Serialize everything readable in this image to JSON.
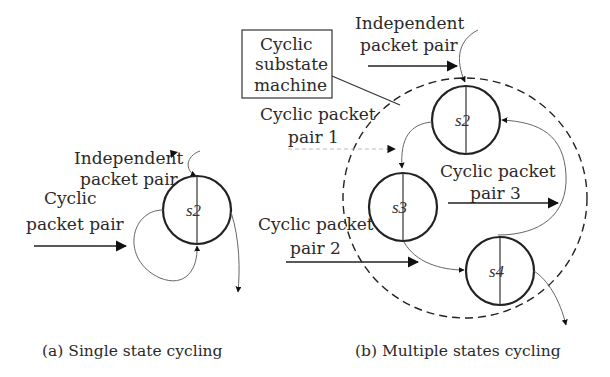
{
  "panel_a": {
    "caption": "(a) Single state cycling",
    "independent_label_line1": "Independent",
    "independent_label_line2": "packet pair",
    "cyclic_label_line1": "Cyclic",
    "cyclic_label_line2": "packet pair",
    "state_s2": "s2"
  },
  "panel_b": {
    "caption": "(b) Multiple states cycling",
    "independent_label_line1": "Independent",
    "independent_label_line2": "packet pair",
    "box_line1": "Cyclic",
    "box_line2": "substate",
    "box_line3": "machine",
    "cyclic1_line1": "Cyclic packet",
    "cyclic1_line2": "pair 1",
    "cyclic2_line1": "Cyclic packet",
    "cyclic2_line2": "pair 2",
    "cyclic3_line1": "Cyclic packet",
    "cyclic3_line2": "pair 3",
    "state_s2": "s2",
    "state_s3": "s3",
    "state_s4": "s4"
  },
  "colors": {
    "stroke": "#222222",
    "text": "#2a2a2a",
    "background": "#ffffff"
  }
}
